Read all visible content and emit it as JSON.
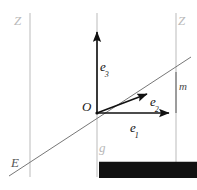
{
  "figure": {
    "background": "#ffffff",
    "width": 197,
    "height": 190,
    "colors": {
      "guide_line": "#c3c3c3",
      "diagonal_line": "#6e6e6e",
      "vector": "#111111",
      "plane_label": "#b9b9b9",
      "dark_label": "#1a1a1a"
    }
  },
  "labels": {
    "plane_left": "Z",
    "plane_right": "Z",
    "line_g": "g",
    "line_E": "E",
    "line_m": "m",
    "origin": "O"
  },
  "vectors": [
    {
      "name": "e3",
      "letter": "e",
      "subscript": "3",
      "direction": "up"
    },
    {
      "name": "e2",
      "letter": "e",
      "subscript": "2",
      "direction": "diagonal-up-right"
    },
    {
      "name": "e1",
      "letter": "e",
      "subscript": "1",
      "direction": "right"
    }
  ],
  "geometry": {
    "vertical_lines_x": [
      30,
      97,
      176
    ],
    "vertical_line_top_y": 13,
    "vertical_line_bottom_y": 177,
    "origin": {
      "x": 97,
      "y": 113
    },
    "e1_tip": {
      "x": 172,
      "y": 113
    },
    "e2_tip": {
      "x": 150,
      "y": 92
    },
    "e3_tip": {
      "x": 97,
      "y": 29
    },
    "diagonal_start": {
      "x": 9,
      "y": 176
    },
    "diagonal_end": {
      "x": 191,
      "y": 57
    },
    "corner_drop": {
      "x": 176,
      "y": 113
    }
  }
}
